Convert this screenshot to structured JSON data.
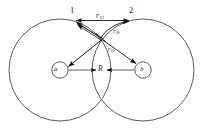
{
  "figure": {
    "type": "physics-diagram",
    "stroke_color": "#3a3a3a",
    "vector_color": "#111111",
    "background": "#ffffff"
  },
  "labels": {
    "electron_1": "1",
    "electron_2": "2",
    "nucleus_a": "a",
    "nucleus_b": "b",
    "internuclear_distance": "R",
    "r12": {
      "base": "r",
      "sub": "12"
    },
    "r2b": {
      "base": "r",
      "sub": "2b"
    },
    "r1b": {
      "base": "r",
      "sub": "1b"
    }
  },
  "geometry": {
    "left_circle": {
      "cx": 60,
      "cy": 70,
      "r": 51
    },
    "right_circle": {
      "cx": 143,
      "cy": 70,
      "r": 51
    },
    "nucleus_a_circle": {
      "cx": 60,
      "cy": 70,
      "r": 8
    },
    "nucleus_b_circle": {
      "cx": 143,
      "cy": 70,
      "r": 8
    },
    "electron_1_point": {
      "x": 73,
      "y": 22
    },
    "electron_2_point": {
      "x": 132,
      "y": 22
    },
    "vertex_point": {
      "x": 101,
      "y": 37
    }
  }
}
